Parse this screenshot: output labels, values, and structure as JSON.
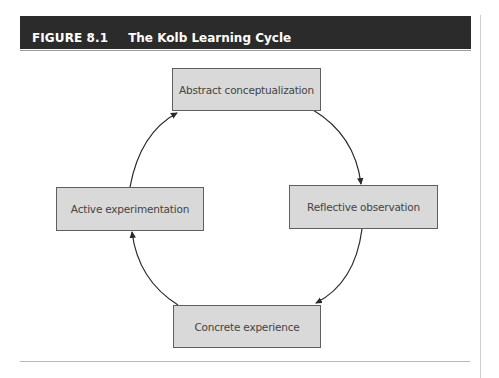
{
  "figure": {
    "label": "FIGURE 8.1",
    "title": "The Kolb Learning Cycle"
  },
  "diagram": {
    "type": "cycle",
    "nodes": [
      {
        "id": "abstract",
        "label": "Abstract conceptualization",
        "position": "top"
      },
      {
        "id": "reflective",
        "label": "Reflective observation",
        "position": "right"
      },
      {
        "id": "concrete",
        "label": "Concrete experience",
        "position": "bottom"
      },
      {
        "id": "active",
        "label": "Active experimentation",
        "position": "left"
      }
    ],
    "edges": [
      {
        "from": "abstract",
        "to": "reflective",
        "direction": "clockwise"
      },
      {
        "from": "reflective",
        "to": "concrete",
        "direction": "clockwise"
      },
      {
        "from": "concrete",
        "to": "active",
        "direction": "clockwise"
      },
      {
        "from": "active",
        "to": "abstract",
        "direction": "clockwise"
      }
    ],
    "colors": {
      "header_bg": "#2b2b2b",
      "header_text": "#ffffff",
      "box_fill": "#d9d9d9",
      "box_border": "#5f5f5f",
      "box_text": "#444444",
      "arrow": "#2a2a2a"
    }
  }
}
